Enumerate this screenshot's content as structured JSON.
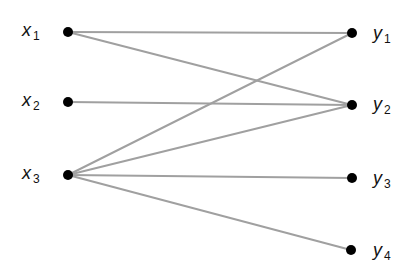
{
  "diagram": {
    "type": "bipartite-graph",
    "edge_color": "#a0a0a0",
    "node_color": "#000000",
    "left_nodes": [
      {
        "id": "x1",
        "base": "x",
        "sub": "1",
        "cx": 68,
        "cy": 32
      },
      {
        "id": "x2",
        "base": "x",
        "sub": "2",
        "cx": 68,
        "cy": 102
      },
      {
        "id": "x3",
        "base": "x",
        "sub": "3",
        "cx": 68,
        "cy": 175
      }
    ],
    "right_nodes": [
      {
        "id": "y1",
        "base": "y",
        "sub": "1",
        "cx": 352,
        "cy": 33
      },
      {
        "id": "y2",
        "base": "y",
        "sub": "2",
        "cx": 352,
        "cy": 105
      },
      {
        "id": "y3",
        "base": "y",
        "sub": "3",
        "cx": 352,
        "cy": 178
      },
      {
        "id": "y4",
        "base": "y",
        "sub": "4",
        "cx": 351,
        "cy": 250
      }
    ],
    "edges": [
      [
        "x1",
        "y1"
      ],
      [
        "x1",
        "y2"
      ],
      [
        "x2",
        "y2"
      ],
      [
        "x3",
        "y1"
      ],
      [
        "x3",
        "y2"
      ],
      [
        "x3",
        "y3"
      ],
      [
        "x3",
        "y4"
      ]
    ]
  }
}
